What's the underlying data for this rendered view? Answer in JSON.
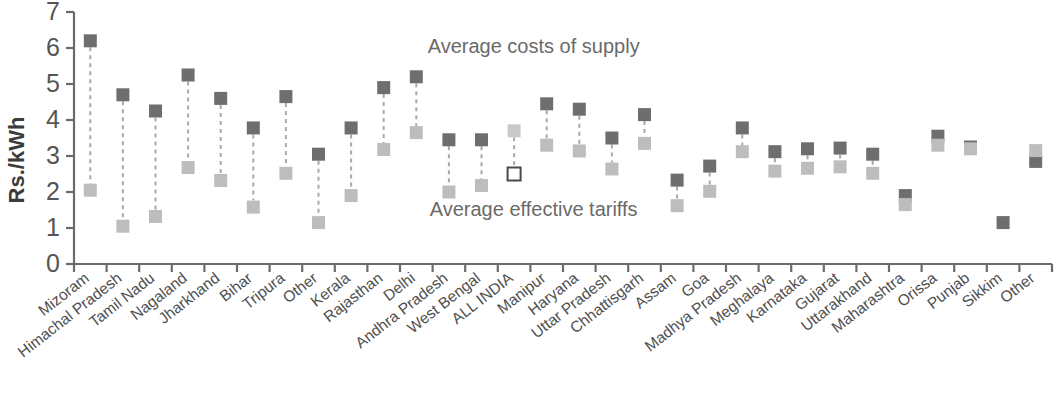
{
  "chart_data": {
    "type": "scatter",
    "title": "",
    "xlabel": "",
    "ylabel": "Rs./kWh",
    "ylim": [
      0,
      7
    ],
    "yticks": [
      0,
      1,
      2,
      3,
      4,
      5,
      6,
      7
    ],
    "ytick_labels": [
      "0",
      "1",
      "2",
      "3",
      "4",
      "5",
      "6",
      "7"
    ],
    "grid": false,
    "legend_position": "inline-annotation",
    "annotations": [
      {
        "text": "Average costs of supply",
        "x_frac": 0.47,
        "y_value": 5.85
      },
      {
        "text": "Average effective tariffs",
        "x_frac": 0.47,
        "y_value": 1.32
      }
    ],
    "categories": [
      "Mizoram",
      "Himachal Pradesh",
      "Tamil Nadu",
      "Nagaland",
      "Jharkhand",
      "Bihar",
      "Tripura",
      "Other",
      "Kerala",
      "Rajasthan",
      "Delhi",
      "Andhra Pradesh",
      "West Bengal",
      "ALL INDIA",
      "Manipur",
      "Haryana",
      "Uttar Pradesh",
      "Chhattisgarh",
      "Assam",
      "Goa",
      "Madhya Pradesh",
      "Meghalaya",
      "Karnataka",
      "Gujarat",
      "Uttarakhand",
      "Maharashtra",
      "Orissa",
      "Punjab",
      "Sikkim",
      "Other"
    ],
    "series": [
      {
        "name": "Average costs of supply",
        "color": "#6e6e6e",
        "marker": "filled-square-dark",
        "values": [
          6.2,
          4.7,
          4.25,
          5.25,
          4.6,
          3.78,
          4.65,
          3.05,
          3.78,
          4.9,
          5.2,
          3.45,
          3.45,
          3.7,
          4.45,
          4.3,
          3.5,
          4.15,
          2.33,
          2.72,
          3.78,
          3.12,
          3.2,
          3.22,
          3.05,
          1.9,
          3.55,
          3.25,
          1.15,
          2.85
        ]
      },
      {
        "name": "Average effective tariffs",
        "color": "#bdbdbd",
        "marker": "filled-square-light",
        "values": [
          2.05,
          1.05,
          1.32,
          2.68,
          2.32,
          1.58,
          2.52,
          1.15,
          1.9,
          3.18,
          3.65,
          2.0,
          2.18,
          2.5,
          3.3,
          3.14,
          2.64,
          3.35,
          1.62,
          2.02,
          3.12,
          2.58,
          2.66,
          2.7,
          2.52,
          1.65,
          3.3,
          3.2,
          null,
          3.15
        ]
      }
    ],
    "special_points": [
      {
        "category": "ALL INDIA",
        "series": "Average costs of supply",
        "style": "light-filled-square"
      },
      {
        "category": "ALL INDIA",
        "series": "Average effective tariffs",
        "style": "hollow-square"
      },
      {
        "category": "Sikkim",
        "series": "Average effective tariffs",
        "style": "not-plotted"
      },
      {
        "category": "Other",
        "series": "Average effective tariffs",
        "style": "above-cost-marker"
      }
    ]
  },
  "colors": {
    "cost_marker": "#6e6e6e",
    "tariff_marker": "#bdbdbd",
    "axis": "#6b6b6b",
    "text": "#4e4e4e",
    "background": "#ffffff"
  }
}
